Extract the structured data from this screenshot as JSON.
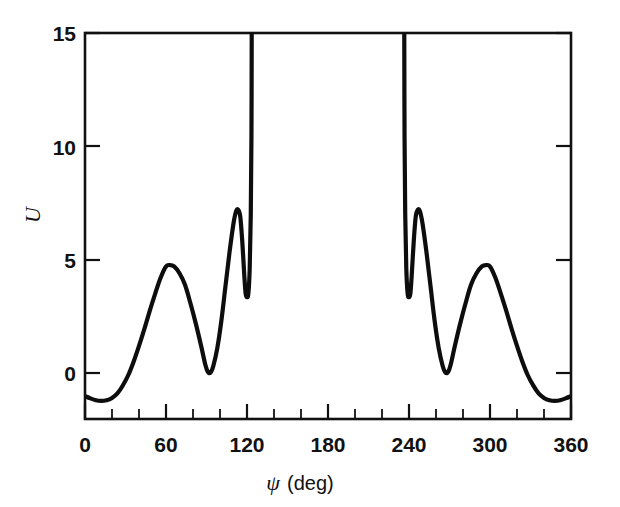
{
  "figure": {
    "background_color": "#ffffff",
    "curve_color": "#0d0d0d",
    "axis_color": "#111111"
  },
  "chart_data": {
    "type": "line",
    "title": "",
    "subtitle": "",
    "xlabel": "ψ (deg)",
    "xlabel_symbol": "ψ",
    "xlabel_unit": "(deg)",
    "ylabel": "U",
    "xlim": [
      0,
      360
    ],
    "ylim": [
      -2.03,
      15
    ],
    "y_axis_display_min": 0,
    "y_axis_display_max": 15,
    "grid": false,
    "legend": null,
    "legend_position": "none",
    "x_ticks_major": [
      0,
      60,
      120,
      180,
      240,
      300,
      360
    ],
    "x_tick_labels": [
      "0",
      "60",
      "120",
      "180",
      "240",
      "300",
      "360"
    ],
    "x_ticks_minor_step": 20,
    "y_ticks_major": [
      0,
      5,
      10,
      15
    ],
    "y_tick_labels": [
      "0",
      "5",
      "10",
      "15"
    ],
    "asymptotes_x": [
      123.5,
      236.5
    ],
    "features": {
      "start_value_at_0": -1.0,
      "first_broad_peak": {
        "x": 60,
        "y": 4.75
      },
      "first_valley": {
        "x": 90,
        "y": 0.0
      },
      "narrow_peak_left": {
        "x": 112,
        "y": 7.2
      },
      "narrow_dip_left": {
        "x": 119,
        "y": 3.35
      },
      "narrow_dip_right": {
        "x": 241,
        "y": 3.35
      },
      "narrow_peak_right": {
        "x": 248,
        "y": 7.2
      },
      "second_valley": {
        "x": 270,
        "y": 0.0
      },
      "second_broad_peak": {
        "x": 300,
        "y": 4.7
      },
      "end_value_at_360": -1.0,
      "global_min_left": {
        "x": 12,
        "y": -1.2
      },
      "global_min_right": {
        "x": 348,
        "y": -1.2
      }
    },
    "points": [
      {
        "x": 0,
        "y": -1.02
      },
      {
        "x": 4,
        "y": -1.12
      },
      {
        "x": 8,
        "y": -1.2
      },
      {
        "x": 12,
        "y": -1.23
      },
      {
        "x": 16,
        "y": -1.2
      },
      {
        "x": 20,
        "y": -1.1
      },
      {
        "x": 24,
        "y": -0.9
      },
      {
        "x": 28,
        "y": -0.55
      },
      {
        "x": 32,
        "y": -0.1
      },
      {
        "x": 36,
        "y": 0.5
      },
      {
        "x": 40,
        "y": 1.2
      },
      {
        "x": 44,
        "y": 1.95
      },
      {
        "x": 48,
        "y": 2.75
      },
      {
        "x": 52,
        "y": 3.5
      },
      {
        "x": 56,
        "y": 4.2
      },
      {
        "x": 60,
        "y": 4.7
      },
      {
        "x": 63,
        "y": 4.76
      },
      {
        "x": 66,
        "y": 4.7
      },
      {
        "x": 70,
        "y": 4.4
      },
      {
        "x": 74,
        "y": 3.9
      },
      {
        "x": 78,
        "y": 3.1
      },
      {
        "x": 82,
        "y": 2.2
      },
      {
        "x": 86,
        "y": 1.2
      },
      {
        "x": 89,
        "y": 0.4
      },
      {
        "x": 91,
        "y": 0.05
      },
      {
        "x": 93,
        "y": 0.02
      },
      {
        "x": 95,
        "y": 0.3
      },
      {
        "x": 98,
        "y": 1.1
      },
      {
        "x": 101,
        "y": 2.3
      },
      {
        "x": 104,
        "y": 3.8
      },
      {
        "x": 107,
        "y": 5.3
      },
      {
        "x": 110,
        "y": 6.6
      },
      {
        "x": 112,
        "y": 7.15
      },
      {
        "x": 113.5,
        "y": 7.2
      },
      {
        "x": 115,
        "y": 6.9
      },
      {
        "x": 116.5,
        "y": 5.8
      },
      {
        "x": 118,
        "y": 4.3
      },
      {
        "x": 119,
        "y": 3.5
      },
      {
        "x": 120,
        "y": 3.35
      },
      {
        "x": 121,
        "y": 3.5
      },
      {
        "x": 122,
        "y": 4.6
      },
      {
        "x": 122.8,
        "y": 7.0
      },
      {
        "x": 123.3,
        "y": 10.5
      },
      {
        "x": 123.5,
        "y": 15.0
      },
      {
        "x": 236.5,
        "y": 15.0
      },
      {
        "x": 236.7,
        "y": 10.5
      },
      {
        "x": 237.2,
        "y": 7.0
      },
      {
        "x": 238,
        "y": 4.6
      },
      {
        "x": 239,
        "y": 3.5
      },
      {
        "x": 240,
        "y": 3.35
      },
      {
        "x": 241,
        "y": 3.5
      },
      {
        "x": 242,
        "y": 4.3
      },
      {
        "x": 243.5,
        "y": 5.8
      },
      {
        "x": 245,
        "y": 6.9
      },
      {
        "x": 246.5,
        "y": 7.2
      },
      {
        "x": 248,
        "y": 7.15
      },
      {
        "x": 250,
        "y": 6.6
      },
      {
        "x": 253,
        "y": 5.3
      },
      {
        "x": 256,
        "y": 3.8
      },
      {
        "x": 259,
        "y": 2.3
      },
      {
        "x": 262,
        "y": 1.1
      },
      {
        "x": 265,
        "y": 0.3
      },
      {
        "x": 267,
        "y": 0.02
      },
      {
        "x": 269,
        "y": 0.05
      },
      {
        "x": 271,
        "y": 0.4
      },
      {
        "x": 274,
        "y": 1.2
      },
      {
        "x": 278,
        "y": 2.2
      },
      {
        "x": 282,
        "y": 3.1
      },
      {
        "x": 286,
        "y": 3.9
      },
      {
        "x": 290,
        "y": 4.4
      },
      {
        "x": 294,
        "y": 4.7
      },
      {
        "x": 297,
        "y": 4.76
      },
      {
        "x": 300,
        "y": 4.7
      },
      {
        "x": 304,
        "y": 4.2
      },
      {
        "x": 308,
        "y": 3.5
      },
      {
        "x": 312,
        "y": 2.75
      },
      {
        "x": 316,
        "y": 1.95
      },
      {
        "x": 320,
        "y": 1.2
      },
      {
        "x": 324,
        "y": 0.5
      },
      {
        "x": 328,
        "y": -0.1
      },
      {
        "x": 332,
        "y": -0.55
      },
      {
        "x": 336,
        "y": -0.9
      },
      {
        "x": 340,
        "y": -1.1
      },
      {
        "x": 344,
        "y": -1.2
      },
      {
        "x": 348,
        "y": -1.23
      },
      {
        "x": 352,
        "y": -1.2
      },
      {
        "x": 356,
        "y": -1.12
      },
      {
        "x": 360,
        "y": -1.02
      }
    ]
  }
}
